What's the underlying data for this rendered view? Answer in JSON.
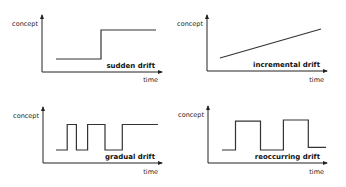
{
  "panels": [
    {
      "id": "sudden",
      "title": "sudden drift",
      "ylabel": "concept",
      "xlabel": "time",
      "signal": [
        [
          0,
          0.25
        ],
        [
          0.45,
          0.25
        ],
        [
          0.45,
          0.8
        ],
        [
          1,
          0.8
        ]
      ]
    },
    {
      "id": "incremental",
      "title": "incremental drift",
      "ylabel": "concept",
      "xlabel": "time",
      "signal": [
        [
          0,
          0.25
        ],
        [
          1,
          0.8
        ]
      ]
    },
    {
      "id": "gradual",
      "title": "gradual drift",
      "ylabel": "concept",
      "xlabel": "time",
      "signal": [
        [
          0,
          0.25
        ],
        [
          0.11,
          0.25
        ],
        [
          0.11,
          0.75
        ],
        [
          0.2,
          0.75
        ],
        [
          0.2,
          0.25
        ],
        [
          0.31,
          0.25
        ],
        [
          0.31,
          0.75
        ],
        [
          0.48,
          0.75
        ],
        [
          0.48,
          0.25
        ],
        [
          0.65,
          0.25
        ],
        [
          0.65,
          0.75
        ],
        [
          1,
          0.75
        ]
      ]
    },
    {
      "id": "reoccurring",
      "title": "reoccurring drift",
      "ylabel": "concept",
      "xlabel": "time",
      "signal": [
        [
          0,
          0.25
        ],
        [
          0.13,
          0.25
        ],
        [
          0.13,
          0.78
        ],
        [
          0.37,
          0.78
        ],
        [
          0.37,
          0.25
        ],
        [
          0.59,
          0.25
        ],
        [
          0.59,
          0.8
        ],
        [
          0.83,
          0.8
        ],
        [
          0.83,
          0.3
        ],
        [
          1,
          0.3
        ]
      ]
    }
  ]
}
